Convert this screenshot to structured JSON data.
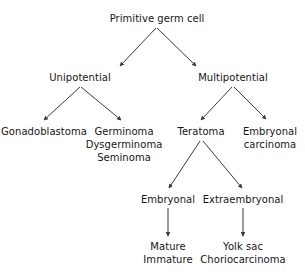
{
  "diagram": {
    "background_color": "#ffffff",
    "text_color": "#161616",
    "arrow_color": "#3b3b3b",
    "nodes": {
      "primitive_germ_cell": {
        "lines": [
          "Primitive germ cell"
        ]
      },
      "unipotential": {
        "lines": [
          "Unipotential"
        ]
      },
      "multipotential": {
        "lines": [
          "Multipotential"
        ]
      },
      "gonadoblastoma": {
        "lines": [
          "Gonadoblastoma"
        ]
      },
      "germinoma_group": {
        "lines": [
          "Germinoma",
          "Dysgerminoma",
          "Seminoma"
        ]
      },
      "teratoma": {
        "lines": [
          "Teratoma"
        ]
      },
      "embryonal_carcinoma": {
        "lines": [
          "Embryonal",
          "carcinoma"
        ]
      },
      "embryonal": {
        "lines": [
          "Embryonal"
        ]
      },
      "extraembryonal": {
        "lines": [
          "Extraembryonal"
        ]
      },
      "mature_immature": {
        "lines": [
          "Mature",
          "Immature"
        ]
      },
      "yolk_sac_group": {
        "lines": [
          "Yolk sac",
          "Choriocarcinoma"
        ]
      }
    },
    "edges": [
      {
        "from": "primitive_germ_cell",
        "to": "unipotential"
      },
      {
        "from": "primitive_germ_cell",
        "to": "multipotential"
      },
      {
        "from": "unipotential",
        "to": "gonadoblastoma"
      },
      {
        "from": "unipotential",
        "to": "germinoma_group"
      },
      {
        "from": "multipotential",
        "to": "teratoma"
      },
      {
        "from": "multipotential",
        "to": "embryonal_carcinoma"
      },
      {
        "from": "teratoma",
        "to": "embryonal"
      },
      {
        "from": "teratoma",
        "to": "extraembryonal"
      },
      {
        "from": "embryonal",
        "to": "mature_immature"
      },
      {
        "from": "extraembryonal",
        "to": "yolk_sac_group"
      }
    ]
  }
}
